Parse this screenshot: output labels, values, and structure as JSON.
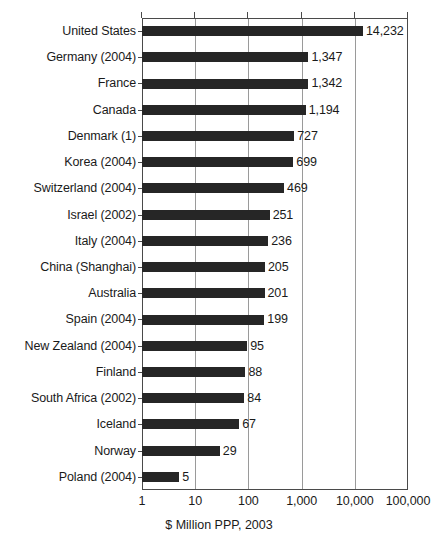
{
  "chart_data": {
    "type": "bar",
    "orientation": "horizontal",
    "title": "",
    "subtitle": "",
    "xlabel": "$ Million PPP, 2003",
    "ylabel": "",
    "xscale": "log",
    "xlim": [
      1,
      100000
    ],
    "xticks": [
      1,
      10,
      100,
      1000,
      10000,
      100000
    ],
    "xticklabels": [
      "1",
      "10",
      "100",
      "1,000",
      "10,000",
      "100,000"
    ],
    "grid": "vertical-only",
    "legend": "none",
    "bar_color": "#262626",
    "categories": [
      "United States",
      "Germany (2004)",
      "France",
      "Canada",
      "Denmark (1)",
      "Korea (2004)",
      "Switzerland (2004)",
      "Israel (2002)",
      "Italy (2004)",
      "China (Shanghai)",
      "Australia",
      "Spain (2004)",
      "New Zealand (2004)",
      "Finland",
      "South Africa (2002)",
      "Iceland",
      "Norway",
      "Poland (2004)"
    ],
    "values": [
      14232,
      1347,
      1342,
      1194,
      727,
      699,
      469,
      251,
      236,
      205,
      201,
      199,
      95,
      88,
      84,
      67,
      29,
      5
    ],
    "value_labels": [
      "14,232",
      "1,347",
      "1,342",
      "1,194",
      "727",
      "699",
      "469",
      "251",
      "236",
      "205",
      "201",
      "199",
      "95",
      "88",
      "84",
      "67",
      "29",
      "5"
    ]
  }
}
